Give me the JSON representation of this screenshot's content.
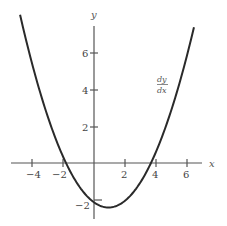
{
  "chart_data": {
    "type": "line",
    "title": "",
    "xlabel": "x",
    "ylabel": "y",
    "xlim": [
      -5.3,
      7.0
    ],
    "ylim": [
      -3.0,
      7.5
    ],
    "x_ticks": [
      -4,
      -2,
      2,
      4,
      6
    ],
    "y_ticks": [
      -2,
      2,
      4,
      6
    ],
    "x_tick_labels": [
      "−4",
      "−2",
      "2",
      "4",
      "6"
    ],
    "y_tick_labels": [
      "−2",
      "2",
      "4",
      "6"
    ],
    "grid": false,
    "legend": null,
    "annotations": [
      {
        "text_numerator": "dy",
        "text_denominator": "dx",
        "x": 5.2,
        "y": 4.2
      }
    ],
    "series": [
      {
        "name": "dy/dx",
        "description": "Upward-opening parabola approx 0.31(x+2)(x-3.7), roots near x=-2 and x=3.7, minimum near (0.85, -2.5)",
        "x": [
          -4.77,
          -4,
          -3,
          -2,
          -1,
          0,
          0.85,
          2,
          3,
          3.7,
          4,
          5,
          6,
          6.45
        ],
        "values": [
          7.26,
          5.7,
          3.8,
          0.0,
          -1.46,
          -2.29,
          -2.52,
          -2.1,
          -1.08,
          0.0,
          0.56,
          3.28,
          5.83,
          7.2
        ]
      }
    ]
  },
  "labels": {
    "x_axis": "x",
    "y_axis": "y",
    "curve_numerator": "dy",
    "curve_denominator": "dx"
  }
}
